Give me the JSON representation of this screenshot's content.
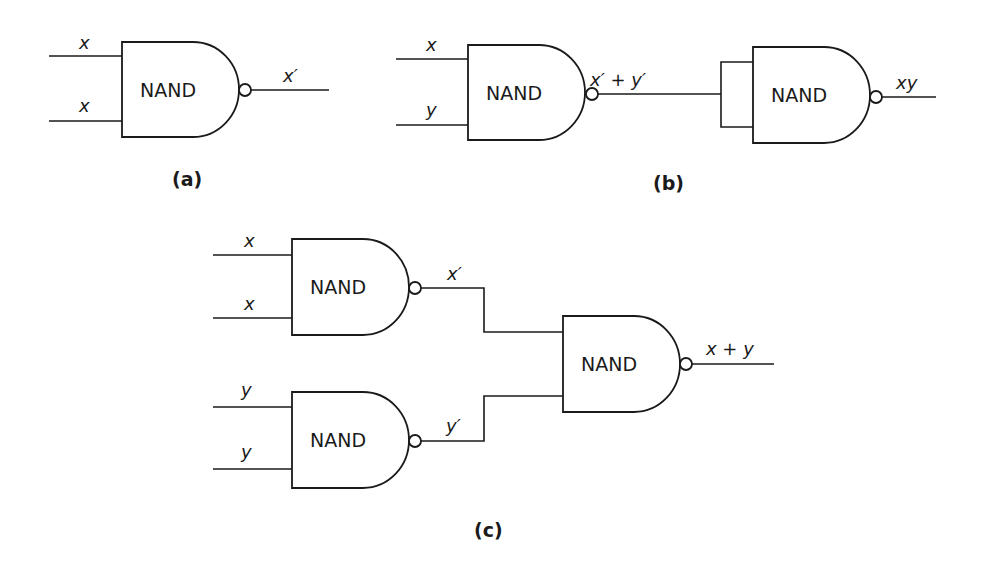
{
  "figure": {
    "panels": [
      {
        "id": "a",
        "caption": "(a)",
        "gates": [
          {
            "label": "NAND",
            "inputs": [
              "x",
              "x"
            ],
            "output": "x′"
          }
        ]
      },
      {
        "id": "b",
        "caption": "(b)",
        "gates": [
          {
            "label": "NAND",
            "inputs": [
              "x",
              "y"
            ],
            "output": "x′ + y′"
          },
          {
            "label": "NAND",
            "inputs": [
              "x′ + y′",
              "x′ + y′"
            ],
            "output": "xy"
          }
        ]
      },
      {
        "id": "c",
        "caption": "(c)",
        "gates": [
          {
            "label": "NAND",
            "inputs": [
              "x",
              "x"
            ],
            "output": "x′"
          },
          {
            "label": "NAND",
            "inputs": [
              "y",
              "y"
            ],
            "output": "y′"
          },
          {
            "label": "NAND",
            "inputs": [
              "x′",
              "y′"
            ],
            "output": "x + y"
          }
        ]
      }
    ]
  }
}
